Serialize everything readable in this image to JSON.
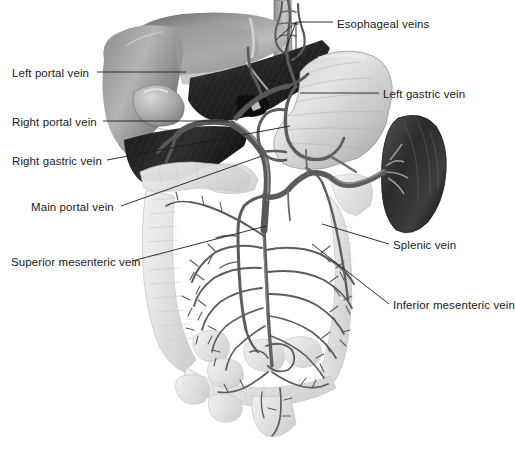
{
  "figure": {
    "style": "grayscale medical illustration",
    "background_color": "#ffffff",
    "label_color": "#1b1b1b",
    "leader_line_color": "#1b1b1b"
  },
  "labels": [
    {
      "id": "esophageal-veins",
      "text": "Esophageal veins",
      "side": "right",
      "x": 337,
      "y": 18
    },
    {
      "id": "left-portal-vein",
      "text": "Left portal vein",
      "side": "left",
      "x": 12,
      "y": 67
    },
    {
      "id": "left-gastric-vein",
      "text": "Left gastric vein",
      "side": "right",
      "x": 383,
      "y": 88
    },
    {
      "id": "right-portal-vein",
      "text": "Right portal vein",
      "side": "left",
      "x": 12,
      "y": 116
    },
    {
      "id": "right-gastric-vein",
      "text": "Right gastric vein",
      "side": "left",
      "x": 12,
      "y": 155
    },
    {
      "id": "main-portal-vein",
      "text": "Main portal vein",
      "side": "left",
      "x": 31,
      "y": 201
    },
    {
      "id": "splenic-vein",
      "text": "Splenic vein",
      "side": "right",
      "x": 393,
      "y": 239
    },
    {
      "id": "superior-mesenteric-vein",
      "text": "Superior mesenteric vein",
      "side": "left",
      "x": 11,
      "y": 256
    },
    {
      "id": "inferior-mesenteric-vein",
      "text": "Inferior mesenteric vein",
      "side": "right",
      "x": 393,
      "y": 299
    }
  ],
  "organs": [
    {
      "id": "liver",
      "name": "Liver",
      "tone": "light-to-dark-gray"
    },
    {
      "id": "gallbladder",
      "name": "Gallbladder",
      "tone": "light-gray"
    },
    {
      "id": "esophagus",
      "name": "Esophagus",
      "tone": "mid-gray"
    },
    {
      "id": "stomach",
      "name": "Stomach",
      "tone": "light-gray"
    },
    {
      "id": "spleen",
      "name": "Spleen",
      "tone": "dark-gray"
    },
    {
      "id": "pancreas",
      "name": "Pancreas",
      "tone": "pale-gray"
    },
    {
      "id": "ascending-colon",
      "name": "Ascending colon",
      "tone": "pale-gray"
    },
    {
      "id": "transverse-colon",
      "name": "Transverse colon",
      "tone": "pale-gray"
    },
    {
      "id": "descending-colon",
      "name": "Descending colon",
      "tone": "pale-gray"
    },
    {
      "id": "small-intestine",
      "name": "Small intestine",
      "tone": "pale-gray"
    },
    {
      "id": "rectum",
      "name": "Rectum",
      "tone": "pale-gray"
    }
  ],
  "vessels": [
    {
      "id": "esophageal-veins",
      "name": "Esophageal veins"
    },
    {
      "id": "left-gastric-vein",
      "name": "Left gastric vein"
    },
    {
      "id": "right-gastric-vein",
      "name": "Right gastric vein"
    },
    {
      "id": "left-portal-vein",
      "name": "Left portal vein"
    },
    {
      "id": "right-portal-vein",
      "name": "Right portal vein"
    },
    {
      "id": "main-portal-vein",
      "name": "Main portal vein"
    },
    {
      "id": "splenic-vein",
      "name": "Splenic vein"
    },
    {
      "id": "superior-mesenteric-vein",
      "name": "Superior mesenteric vein"
    },
    {
      "id": "inferior-mesenteric-vein",
      "name": "Inferior mesenteric vein"
    }
  ]
}
